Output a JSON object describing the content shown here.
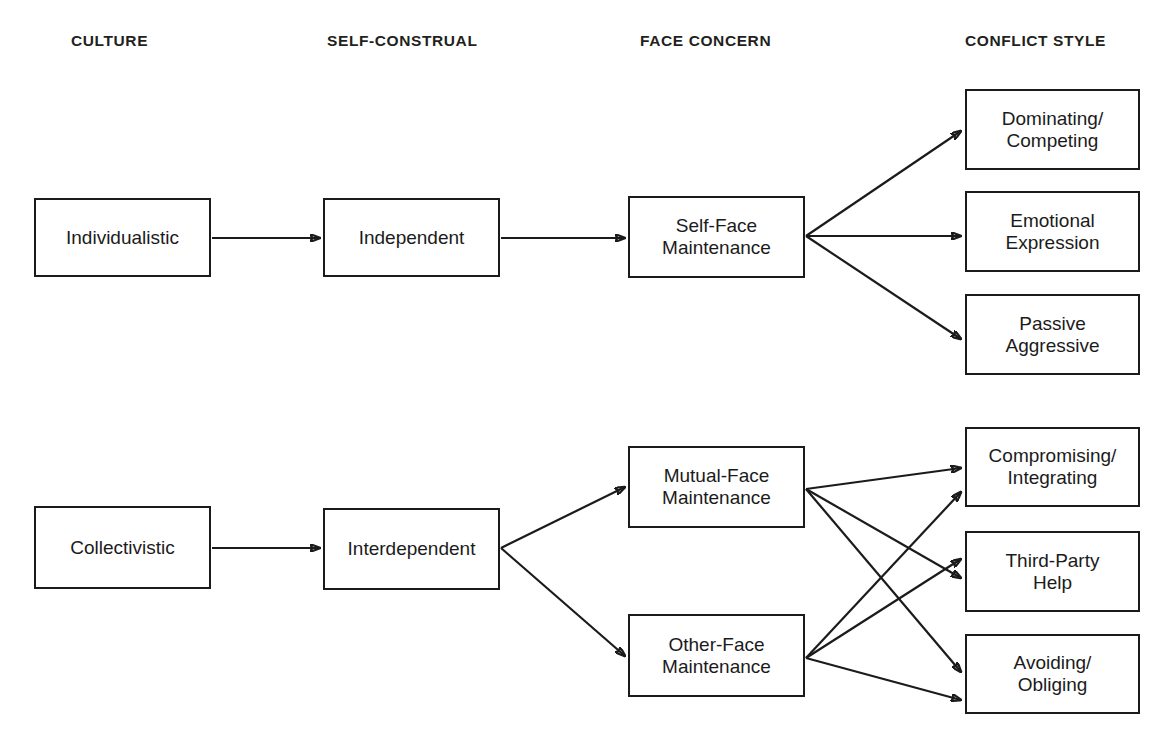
{
  "diagram": {
    "columns": [
      {
        "id": "culture",
        "label": "CULTURE",
        "x": 71,
        "y": 33
      },
      {
        "id": "self-construal",
        "label": "SELF-CONSTRUAL",
        "x": 327,
        "y": 33
      },
      {
        "id": "face-concern",
        "label": "FACE CONCERN",
        "x": 640,
        "y": 33
      },
      {
        "id": "conflict-style",
        "label": "CONFLICT STYLE",
        "x": 965,
        "y": 33
      }
    ],
    "nodes": [
      {
        "id": "individualistic",
        "label": "Individualistic",
        "x": 34,
        "y": 198,
        "w": 177,
        "h": 79
      },
      {
        "id": "independent",
        "label": "Independent",
        "x": 323,
        "y": 198,
        "w": 177,
        "h": 79
      },
      {
        "id": "self-face",
        "label": "Self-Face\nMaintenance",
        "x": 628,
        "y": 196,
        "w": 177,
        "h": 82
      },
      {
        "id": "dominating",
        "label": "Dominating/\nCompeting",
        "x": 965,
        "y": 89,
        "w": 175,
        "h": 81
      },
      {
        "id": "emotional",
        "label": "Emotional\nExpression",
        "x": 965,
        "y": 191,
        "w": 175,
        "h": 81
      },
      {
        "id": "passive",
        "label": "Passive\nAggressive",
        "x": 965,
        "y": 294,
        "w": 175,
        "h": 81
      },
      {
        "id": "collectivistic",
        "label": "Collectivistic",
        "x": 34,
        "y": 506,
        "w": 177,
        "h": 83
      },
      {
        "id": "interdependent",
        "label": "Interdependent",
        "x": 323,
        "y": 508,
        "w": 177,
        "h": 82
      },
      {
        "id": "mutual-face",
        "label": "Mutual-Face\nMaintenance",
        "x": 628,
        "y": 446,
        "w": 177,
        "h": 82
      },
      {
        "id": "other-face",
        "label": "Other-Face\nMaintenance",
        "x": 628,
        "y": 614,
        "w": 177,
        "h": 83
      },
      {
        "id": "compromising",
        "label": "Compromising/\nIntegrating",
        "x": 965,
        "y": 427,
        "w": 175,
        "h": 80
      },
      {
        "id": "third-party",
        "label": "Third-Party\nHelp",
        "x": 965,
        "y": 531,
        "w": 175,
        "h": 81
      },
      {
        "id": "avoiding",
        "label": "Avoiding/\nObliging",
        "x": 965,
        "y": 634,
        "w": 175,
        "h": 80
      }
    ],
    "edges": [
      {
        "id": "individualistic-to-independent",
        "x1": 212,
        "y1": 238,
        "x2": 320,
        "y2": 238
      },
      {
        "id": "independent-to-self-face",
        "x1": 501,
        "y1": 238,
        "x2": 625,
        "y2": 238
      },
      {
        "id": "self-face-to-dominating",
        "x1": 806,
        "y1": 236,
        "x2": 961,
        "y2": 131
      },
      {
        "id": "self-face-to-emotional",
        "x1": 806,
        "y1": 236,
        "x2": 961,
        "y2": 236
      },
      {
        "id": "self-face-to-passive",
        "x1": 806,
        "y1": 236,
        "x2": 961,
        "y2": 339
      },
      {
        "id": "collectivistic-to-interdependent",
        "x1": 212,
        "y1": 548,
        "x2": 320,
        "y2": 548
      },
      {
        "id": "interdependent-to-mutual-face",
        "x1": 501,
        "y1": 548,
        "x2": 625,
        "y2": 487
      },
      {
        "id": "interdependent-to-other-face",
        "x1": 501,
        "y1": 548,
        "x2": 625,
        "y2": 656
      },
      {
        "id": "mutual-face-to-compromising",
        "x1": 806,
        "y1": 489,
        "x2": 961,
        "y2": 468
      },
      {
        "id": "mutual-face-to-third-party",
        "x1": 806,
        "y1": 489,
        "x2": 961,
        "y2": 578
      },
      {
        "id": "mutual-face-to-avoiding",
        "x1": 806,
        "y1": 489,
        "x2": 961,
        "y2": 672
      },
      {
        "id": "other-face-to-compromising",
        "x1": 806,
        "y1": 658,
        "x2": 961,
        "y2": 492
      },
      {
        "id": "other-face-to-third-party",
        "x1": 806,
        "y1": 658,
        "x2": 961,
        "y2": 559
      },
      {
        "id": "other-face-to-avoiding",
        "x1": 806,
        "y1": 658,
        "x2": 961,
        "y2": 700
      }
    ],
    "colors": {
      "background": "#ffffff",
      "stroke": "#1b1b1b",
      "text": "#1b1b1b",
      "header_text": "#231f20"
    }
  }
}
